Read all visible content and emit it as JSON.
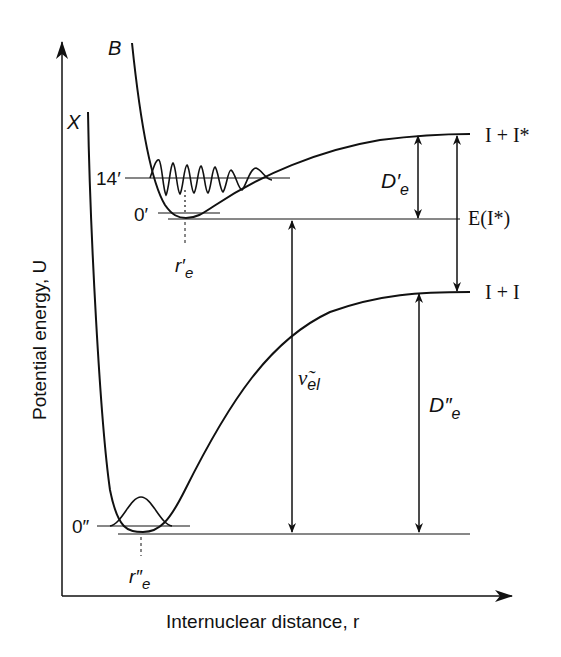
{
  "diagram": {
    "axes": {
      "ylabel": "Potential energy, U",
      "xlabel": "Internuclear distance, r"
    },
    "curves": [
      {
        "name": "X",
        "label": "X",
        "asymptote": "I + I"
      },
      {
        "name": "B",
        "label": "B",
        "asymptote": "I + I*"
      }
    ],
    "levels": {
      "x_v0": "0″",
      "b_v0": "0′",
      "b_v14": "14′"
    },
    "equilibrium": {
      "b_re": "r′",
      "b_re_sub": "e",
      "x_re": "r″",
      "x_re_sub": "e"
    },
    "arrows": {
      "de_prime": {
        "main": "D′",
        "sub": "e"
      },
      "de_dprime": {
        "main": "D″",
        "sub": "e"
      },
      "e_istar": "E(I*)",
      "nu_el": {
        "main": "ν̃",
        "sub": "el"
      }
    },
    "asymptote_labels": {
      "upper": "I + I*",
      "lower": "I + I"
    }
  },
  "colors": {
    "line": "#111111",
    "background": "#ffffff"
  }
}
